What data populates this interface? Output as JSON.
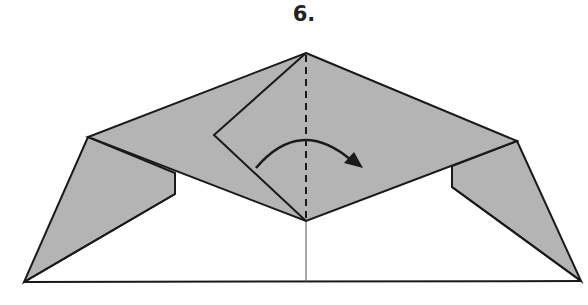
{
  "step": {
    "label": "6."
  },
  "colors": {
    "paper_fill": "#b4b4b4",
    "line": "#1a1a1a",
    "background": "#ffffff"
  },
  "diagram": {
    "fold_line": "valley (dashed)",
    "arrow_direction": "left-to-right"
  }
}
